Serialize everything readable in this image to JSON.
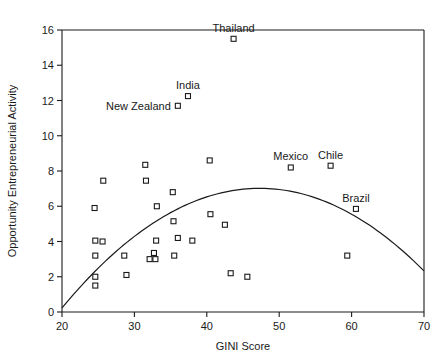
{
  "chart_data": {
    "type": "scatter",
    "title": "",
    "xlabel": "GINI Score",
    "ylabel": "Opportunity Entrepreneurial Activity",
    "xlim": [
      20,
      70
    ],
    "ylim": [
      0,
      16
    ],
    "xticks": [
      20,
      30,
      40,
      50,
      60,
      70
    ],
    "yticks": [
      0,
      2,
      4,
      6,
      8,
      10,
      12,
      14,
      16
    ],
    "grid": false,
    "legend": "none",
    "marker_style": "open-square",
    "points": [
      {
        "x": 24.6,
        "y": 4.05,
        "label": ""
      },
      {
        "x": 24.6,
        "y": 3.2,
        "label": ""
      },
      {
        "x": 24.6,
        "y": 2.0,
        "label": ""
      },
      {
        "x": 24.6,
        "y": 1.5,
        "label": ""
      },
      {
        "x": 24.5,
        "y": 5.9,
        "label": ""
      },
      {
        "x": 25.6,
        "y": 4.0,
        "label": ""
      },
      {
        "x": 25.7,
        "y": 7.45,
        "label": ""
      },
      {
        "x": 28.6,
        "y": 3.2,
        "label": ""
      },
      {
        "x": 28.9,
        "y": 2.1,
        "label": ""
      },
      {
        "x": 31.5,
        "y": 8.35,
        "label": ""
      },
      {
        "x": 31.6,
        "y": 7.45,
        "label": ""
      },
      {
        "x": 32.1,
        "y": 3.0,
        "label": ""
      },
      {
        "x": 32.7,
        "y": 3.35,
        "label": ""
      },
      {
        "x": 32.9,
        "y": 3.0,
        "label": ""
      },
      {
        "x": 33.0,
        "y": 4.05,
        "label": ""
      },
      {
        "x": 33.1,
        "y": 6.0,
        "label": ""
      },
      {
        "x": 35.3,
        "y": 6.8,
        "label": ""
      },
      {
        "x": 35.4,
        "y": 5.15,
        "label": ""
      },
      {
        "x": 35.5,
        "y": 3.2,
        "label": ""
      },
      {
        "x": 36.0,
        "y": 4.2,
        "label": ""
      },
      {
        "x": 36.0,
        "y": 11.7,
        "label": "New Zealand",
        "label_pos": "left"
      },
      {
        "x": 37.4,
        "y": 12.25,
        "label": "India",
        "label_pos": "top"
      },
      {
        "x": 38.0,
        "y": 4.05,
        "label": ""
      },
      {
        "x": 40.4,
        "y": 8.6,
        "label": ""
      },
      {
        "x": 40.5,
        "y": 5.55,
        "label": ""
      },
      {
        "x": 42.5,
        "y": 4.95,
        "label": ""
      },
      {
        "x": 43.3,
        "y": 2.2,
        "label": ""
      },
      {
        "x": 43.7,
        "y": 15.5,
        "label": "Thailand",
        "label_pos": "top"
      },
      {
        "x": 45.6,
        "y": 2.0,
        "label": ""
      },
      {
        "x": 51.6,
        "y": 8.2,
        "label": "Mexico",
        "label_pos": "top"
      },
      {
        "x": 57.1,
        "y": 8.3,
        "label": "Chile",
        "label_pos": "top"
      },
      {
        "x": 59.4,
        "y": 3.2,
        "label": ""
      },
      {
        "x": 60.6,
        "y": 5.85,
        "label": "Brazil",
        "label_pos": "top"
      }
    ],
    "fit_curve": {
      "description": "quadratic fit",
      "a": -0.0091,
      "b": 0.861,
      "c": -13.35,
      "x_start": 20,
      "x_end": 70
    }
  }
}
